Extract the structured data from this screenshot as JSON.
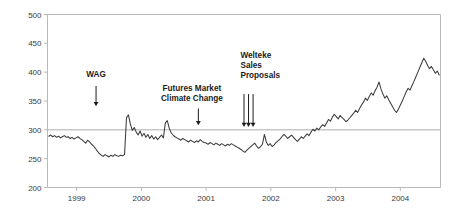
{
  "chart_data": {
    "type": "line",
    "title": "",
    "subtitle": "",
    "xlabel": "",
    "ylabel": "",
    "xlim": [
      1998.55,
      2004.62
    ],
    "ylim": [
      200,
      500
    ],
    "grid": false,
    "legend": "none",
    "y_ticks": [
      200,
      250,
      300,
      350,
      400,
      450,
      500
    ],
    "y_tick_labels": [
      "200",
      "250",
      "300",
      "350",
      "400",
      "450",
      "500"
    ],
    "x_ticks": [
      1999,
      2000,
      2001,
      2002,
      2003,
      2004
    ],
    "x_tick_labels": [
      "1999",
      "2000",
      "2001",
      "2002",
      "2003",
      "2004"
    ],
    "reference_lines": [
      {
        "name": "level-300-line",
        "axis": "y",
        "value": 300,
        "color": "#aeaeae"
      }
    ],
    "series": [
      {
        "name": "index-level",
        "color": "#3b3b3b",
        "x": [
          1998.57,
          1998.6,
          1998.63,
          1998.66,
          1998.69,
          1998.72,
          1998.75,
          1998.78,
          1998.81,
          1998.84,
          1998.87,
          1998.9,
          1998.93,
          1998.96,
          1998.99,
          1999.02,
          1999.05,
          1999.08,
          1999.11,
          1999.14,
          1999.17,
          1999.2,
          1999.23,
          1999.26,
          1999.29,
          1999.32,
          1999.35,
          1999.38,
          1999.41,
          1999.44,
          1999.47,
          1999.5,
          1999.53,
          1999.56,
          1999.59,
          1999.62,
          1999.65,
          1999.68,
          1999.71,
          1999.74,
          1999.77,
          1999.8,
          1999.83,
          1999.86,
          1999.89,
          1999.92,
          1999.95,
          1999.98,
          2000.01,
          2000.04,
          2000.07,
          2000.1,
          2000.13,
          2000.16,
          2000.19,
          2000.22,
          2000.25,
          2000.28,
          2000.31,
          2000.34,
          2000.37,
          2000.4,
          2000.43,
          2000.46,
          2000.49,
          2000.52,
          2000.55,
          2000.58,
          2000.61,
          2000.64,
          2000.67,
          2000.7,
          2000.73,
          2000.76,
          2000.79,
          2000.82,
          2000.85,
          2000.88,
          2000.91,
          2000.94,
          2000.97,
          2001.0,
          2001.03,
          2001.06,
          2001.09,
          2001.12,
          2001.15,
          2001.18,
          2001.21,
          2001.24,
          2001.27,
          2001.3,
          2001.33,
          2001.36,
          2001.39,
          2001.42,
          2001.45,
          2001.48,
          2001.51,
          2001.54,
          2001.57,
          2001.6,
          2001.63,
          2001.66,
          2001.69,
          2001.72,
          2001.75,
          2001.78,
          2001.81,
          2001.84,
          2001.87,
          2001.9,
          2001.93,
          2001.96,
          2001.99,
          2002.02,
          2002.05,
          2002.08,
          2002.11,
          2002.14,
          2002.17,
          2002.2,
          2002.23,
          2002.26,
          2002.29,
          2002.32,
          2002.35,
          2002.38,
          2002.41,
          2002.44,
          2002.47,
          2002.5,
          2002.53,
          2002.56,
          2002.59,
          2002.62,
          2002.65,
          2002.68,
          2002.71,
          2002.74,
          2002.77,
          2002.8,
          2002.83,
          2002.86,
          2002.89,
          2002.92,
          2002.95,
          2002.98,
          2003.01,
          2003.04,
          2003.07,
          2003.1,
          2003.13,
          2003.16,
          2003.19,
          2003.22,
          2003.25,
          2003.28,
          2003.31,
          2003.34,
          2003.37,
          2003.4,
          2003.43,
          2003.46,
          2003.49,
          2003.52,
          2003.55,
          2003.58,
          2003.61,
          2003.64,
          2003.67,
          2003.7,
          2003.73,
          2003.76,
          2003.79,
          2003.82,
          2003.85,
          2003.88,
          2003.91,
          2003.94,
          2003.97,
          2004.0,
          2004.03,
          2004.06,
          2004.09,
          2004.12,
          2004.15,
          2004.18,
          2004.21,
          2004.24,
          2004.27,
          2004.3,
          2004.33,
          2004.36,
          2004.39,
          2004.42,
          2004.45,
          2004.48,
          2004.51,
          2004.54,
          2004.57,
          2004.6
        ],
        "y": [
          289,
          291,
          288,
          290,
          287,
          289,
          286,
          288,
          290,
          287,
          288,
          285,
          287,
          284,
          286,
          288,
          285,
          283,
          280,
          277,
          282,
          279,
          275,
          272,
          268,
          263,
          259,
          256,
          254,
          257,
          255,
          253,
          256,
          254,
          257,
          255,
          254,
          256,
          255,
          257,
          321,
          326,
          310,
          299,
          304,
          296,
          291,
          298,
          289,
          294,
          287,
          292,
          285,
          290,
          284,
          288,
          283,
          287,
          291,
          286,
          312,
          316,
          303,
          295,
          291,
          288,
          286,
          284,
          282,
          285,
          283,
          281,
          279,
          282,
          280,
          278,
          281,
          279,
          283,
          280,
          278,
          277,
          275,
          278,
          276,
          274,
          277,
          275,
          273,
          276,
          274,
          272,
          275,
          273,
          276,
          274,
          272,
          270,
          268,
          266,
          263,
          261,
          265,
          268,
          271,
          274,
          277,
          272,
          268,
          271,
          275,
          292,
          279,
          273,
          276,
          271,
          274,
          278,
          281,
          284,
          288,
          292,
          289,
          285,
          288,
          291,
          287,
          283,
          280,
          284,
          288,
          285,
          289,
          293,
          290,
          296,
          301,
          298,
          303,
          300,
          305,
          309,
          306,
          312,
          318,
          315,
          322,
          327,
          323,
          319,
          325,
          321,
          318,
          314,
          317,
          321,
          325,
          329,
          334,
          330,
          337,
          343,
          348,
          355,
          351,
          358,
          364,
          360,
          368,
          374,
          383,
          371,
          362,
          355,
          359,
          352,
          346,
          340,
          334,
          330,
          336,
          343,
          350,
          358,
          366,
          372,
          369,
          377,
          384,
          392,
          400,
          408,
          416,
          424,
          419,
          412,
          406,
          410,
          404,
          398,
          402,
          395
        ]
      }
    ],
    "annotations": [
      {
        "name": "wag-annotation",
        "lines": [
          "WAG"
        ],
        "label_x": 1999.3,
        "label_y": 392,
        "arrows": [
          {
            "x": 1999.3,
            "y_from": 376,
            "y_to": 341
          }
        ],
        "align": "center"
      },
      {
        "name": "futures-market-climate-change-annotation",
        "lines": [
          "Futures Market",
          "Climate Change"
        ],
        "label_x": 2000.78,
        "label_y": 368,
        "arrows": [
          {
            "x": 2000.88,
            "y_from": 337,
            "y_to": 308
          }
        ],
        "align": "center"
      },
      {
        "name": "welteke-sales-proposals-annotation",
        "lines": [
          "Welteke",
          "Sales",
          "Proposals"
        ],
        "label_x": 2001.53,
        "label_y": 425,
        "arrows": [
          {
            "x": 2001.585,
            "y_from": 362,
            "y_to": 305
          },
          {
            "x": 2001.655,
            "y_from": 362,
            "y_to": 305
          },
          {
            "x": 2001.725,
            "y_from": 362,
            "y_to": 305
          }
        ],
        "align": "start"
      }
    ]
  }
}
